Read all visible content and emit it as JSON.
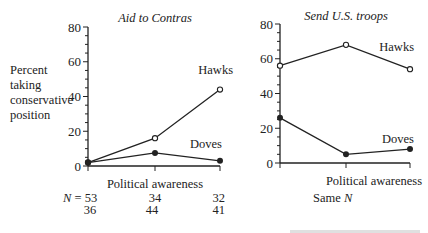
{
  "ylabel_left": [
    "Percent",
    "taking",
    "conservative",
    "position"
  ],
  "left_n_label": "N = 53",
  "left_n": {
    "row1": [
      "53",
      "34",
      "32"
    ],
    "row2": [
      "36",
      "44",
      "41"
    ],
    "prefix": "N ="
  },
  "right_footnote": "Same N",
  "chart_data": [
    {
      "type": "line",
      "title": "Aid to Contras",
      "xlabel": "Political awareness",
      "ylabel": "Percent taking conservative position",
      "ylim": [
        0,
        80
      ],
      "yticks": [
        0,
        20,
        40,
        60,
        80
      ],
      "x": [
        "low",
        "middle",
        "high"
      ],
      "series": [
        {
          "name": "Hawks",
          "marker": "open-circle",
          "values": [
            2,
            16,
            44
          ]
        },
        {
          "name": "Doves",
          "marker": "filled-circle",
          "values": [
            2,
            7.5,
            3
          ]
        }
      ],
      "sample_sizes": {
        "Hawks": [
          53,
          34,
          32
        ],
        "Doves": [
          36,
          44,
          41
        ]
      },
      "grid": false
    },
    {
      "type": "line",
      "title": "Send U.S. troops",
      "xlabel": "Political awareness",
      "ylim": [
        0,
        80
      ],
      "yticks": [
        0,
        20,
        40,
        60,
        80
      ],
      "x": [
        "low",
        "middle",
        "high"
      ],
      "series": [
        {
          "name": "Hawks",
          "marker": "open-circle",
          "values": [
            56,
            68,
            54
          ]
        },
        {
          "name": "Doves",
          "marker": "filled-circle",
          "values": [
            26,
            5,
            8
          ]
        }
      ],
      "note": "Same N",
      "grid": false
    }
  ]
}
